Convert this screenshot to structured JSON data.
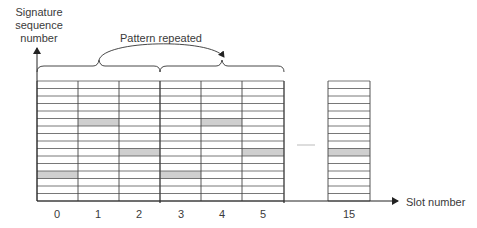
{
  "diagram": {
    "y_axis_label": [
      "Signature",
      "sequence",
      "number"
    ],
    "x_axis_label": "Slot number",
    "brace_label": "Pattern repeated",
    "rows_per_slot": 16,
    "slots_shown": [
      "0",
      "1",
      "2",
      "3",
      "4",
      "5",
      "15"
    ],
    "ellipsis_between": [
      "5",
      "15"
    ],
    "shaded_row_index_from_top": {
      "0": 12,
      "1": 5,
      "2": 9,
      "3": 12,
      "4": 5,
      "5": 9,
      "15": 9
    },
    "pattern_groups": [
      [
        "0",
        "1",
        "2"
      ],
      [
        "3",
        "4",
        "5"
      ]
    ],
    "colors": {
      "line": "#444444",
      "shade": "#cfcfcf",
      "text": "#3a3a3a"
    }
  }
}
